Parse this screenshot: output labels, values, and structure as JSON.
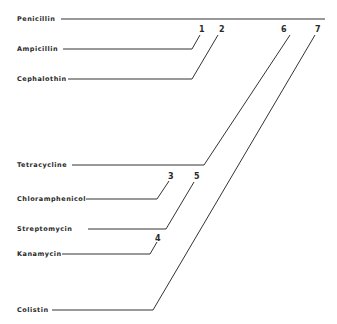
{
  "diagram": {
    "type": "cross-resistance-tree",
    "root": {
      "label": "Penicillin",
      "line": {
        "x1": 61,
        "y1": 19,
        "x2": 325,
        "y2": 19
      },
      "label_pos": {
        "x": 17,
        "y": 21
      }
    },
    "branches": [
      {
        "id": "ampicillin",
        "label": "Ampicillin",
        "label_pos": {
          "x": 17,
          "y": 51
        },
        "points": "63,49 192,49 200,35",
        "number": "1",
        "number_pos": {
          "x": 199,
          "y": 32
        }
      },
      {
        "id": "cephalothin",
        "label": "Cephalothin",
        "label_pos": {
          "x": 17,
          "y": 81
        },
        "points": "68,79 192,79 218,35",
        "number": "2",
        "number_pos": {
          "x": 219,
          "y": 32
        }
      },
      {
        "id": "tetracycline",
        "label": "Tetracycline",
        "label_pos": {
          "x": 17,
          "y": 167
        },
        "points": "72,165 204,165 290,35",
        "number": "6",
        "number_pos": {
          "x": 281,
          "y": 32
        }
      },
      {
        "id": "chloramphenicol",
        "label": "Chloramphenicol",
        "label_pos": {
          "x": 17,
          "y": 201
        },
        "points": "86,199 157,199 169,181",
        "number": "3",
        "number_pos": {
          "x": 168,
          "y": 179
        }
      },
      {
        "id": "streptomycin",
        "label": "Streptomycin",
        "label_pos": {
          "x": 17,
          "y": 231
        },
        "points": "88,229 166,229 194,182",
        "number": "5",
        "number_pos": {
          "x": 194,
          "y": 179
        }
      },
      {
        "id": "kanamycin",
        "label": "Kanamycin",
        "label_pos": {
          "x": 17,
          "y": 256
        },
        "points": "62,254 150,254 157,242",
        "number": "4",
        "number_pos": {
          "x": 155,
          "y": 241
        }
      },
      {
        "id": "colistin",
        "label": "Colistin",
        "label_pos": {
          "x": 17,
          "y": 312
        },
        "points": "52,310 153,310 315,35",
        "number": "7",
        "number_pos": {
          "x": 315,
          "y": 32
        }
      }
    ]
  }
}
